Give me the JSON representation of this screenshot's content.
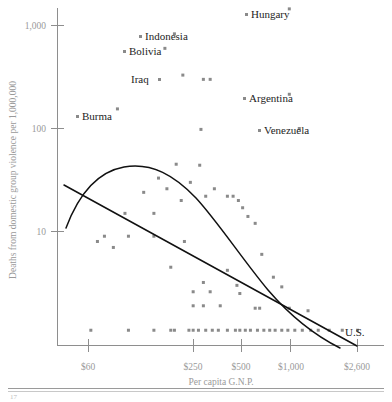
{
  "chart_data": {
    "type": "scatter",
    "title": "",
    "xlabel": "Per capita G.N.P.",
    "ylabel": "Deaths from domestic group violence per 1,000,000",
    "xscale": "log",
    "yscale": "log",
    "xticks": [
      "$60",
      "$250",
      "$500",
      "$1,000",
      "$2,600"
    ],
    "xtick_values": [
      60,
      250,
      500,
      1000,
      2600
    ],
    "yticks": [
      "1,000",
      "100",
      "10"
    ],
    "ytick_values": [
      1000,
      100,
      10
    ],
    "grid": false,
    "legend": "none",
    "annotations": [
      {
        "label": "Hungary",
        "x": 1000,
        "y": 1450
      },
      {
        "label": "Indonesia",
        "x": 200,
        "y": 830
      },
      {
        "label": "Bolivia",
        "x": 175,
        "y": 600
      },
      {
        "label": "Iraq",
        "x": 225,
        "y": 330
      },
      {
        "label": "Argentina",
        "x": 1000,
        "y": 215
      },
      {
        "label": "Burma",
        "x": 90,
        "y": 155
      },
      {
        "label": "Venezuela",
        "x": 1150,
        "y": 100
      },
      {
        "label": "U.S.",
        "x": 2600,
        "y": 1.4
      }
    ],
    "labeled_note": "Eight countries are named; remaining points are unlabeled.",
    "series": [
      {
        "name": "countries",
        "points": [
          [
            200,
            830
          ],
          [
            175,
            600
          ],
          [
            225,
            330
          ],
          [
            300,
            300
          ],
          [
            330,
            300
          ],
          [
            1000,
            1450
          ],
          [
            1000,
            215
          ],
          [
            1150,
            100
          ],
          [
            90,
            155
          ],
          [
            290,
            98
          ],
          [
            205,
            45
          ],
          [
            285,
            44
          ],
          [
            160,
            33
          ],
          [
            250,
            30
          ],
          [
            180,
            26
          ],
          [
            350,
            26
          ],
          [
            130,
            24
          ],
          [
            310,
            22
          ],
          [
            420,
            22
          ],
          [
            455,
            22
          ],
          [
            220,
            20
          ],
          [
            490,
            20
          ],
          [
            520,
            17
          ],
          [
            100,
            15
          ],
          [
            150,
            15
          ],
          [
            560,
            14
          ],
          [
            620,
            12
          ],
          [
            75,
            9
          ],
          [
            105,
            9
          ],
          [
            150,
            9
          ],
          [
            68,
            8
          ],
          [
            230,
            8
          ],
          [
            85,
            7
          ],
          [
            680,
            6
          ],
          [
            190,
            4.5
          ],
          [
            420,
            4.2
          ],
          [
            800,
            3.6
          ],
          [
            300,
            3.2
          ],
          [
            480,
            3.0
          ],
          [
            900,
            2.9
          ],
          [
            260,
            2.6
          ],
          [
            330,
            2.6
          ],
          [
            500,
            2.5
          ],
          [
            260,
            1.9
          ],
          [
            300,
            1.9
          ],
          [
            380,
            1.9
          ],
          [
            620,
            1.8
          ],
          [
            660,
            1.8
          ],
          [
            1000,
            1.8
          ],
          [
            1300,
            1.7
          ],
          [
            62,
            1.1
          ],
          [
            105,
            1.1
          ],
          [
            150,
            1.1
          ],
          [
            190,
            1.1
          ],
          [
            200,
            1.1
          ],
          [
            245,
            1.1
          ],
          [
            260,
            1.1
          ],
          [
            280,
            1.1
          ],
          [
            310,
            1.1
          ],
          [
            340,
            1.1
          ],
          [
            370,
            1.1
          ],
          [
            420,
            1.1
          ],
          [
            470,
            1.1
          ],
          [
            500,
            1.1
          ],
          [
            540,
            1.1
          ],
          [
            580,
            1.1
          ],
          [
            640,
            1.1
          ],
          [
            700,
            1.1
          ],
          [
            760,
            1.1
          ],
          [
            820,
            1.1
          ],
          [
            900,
            1.1
          ],
          [
            980,
            1.1
          ],
          [
            1080,
            1.1
          ],
          [
            1200,
            1.1
          ],
          [
            1350,
            1.1
          ],
          [
            1500,
            1.1
          ],
          [
            1750,
            1.1
          ],
          [
            2100,
            1.1
          ],
          [
            2600,
            1.1
          ]
        ]
      }
    ],
    "fitted_curves": [
      {
        "name": "quadratic-fit",
        "shape": "inverted-u",
        "description": "Curvilinear fit peaking near $200 per capita G.N.P. at roughly 40 deaths per million, falling toward the U.S. end."
      },
      {
        "name": "linear-fit",
        "shape": "straight-line",
        "description": "Downward-sloping straight line from about 30 deaths per million at the low-income end to about 1 at $2,600."
      }
    ]
  },
  "axis": {
    "y_title": "Deaths from domestic group violence per 1,000,000",
    "x_title": "Per capita G.N.P."
  }
}
